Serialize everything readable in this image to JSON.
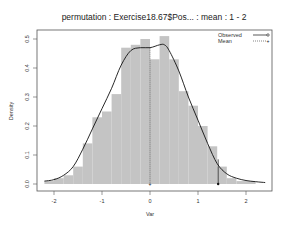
{
  "chart_data": {
    "type": "histogram",
    "title": "permutation : Exercise18.67$Pos... : mean : 1 - 2",
    "xlabel": "Var",
    "ylabel": "Density",
    "xlim": [
      -2.3,
      2.5
    ],
    "ylim": [
      0,
      0.52
    ],
    "xticks": [
      -2,
      -1,
      0,
      1,
      2
    ],
    "yticks": [
      0.0,
      0.1,
      0.2,
      0.3,
      0.4,
      0.5
    ],
    "xtick_labels": [
      "-2",
      "-1",
      "0",
      "1",
      "2"
    ],
    "ytick_labels": [
      "0.0",
      "0.1",
      "0.2",
      "0.3",
      "0.4",
      "0.5"
    ],
    "grid": false,
    "legend_position": "top-right",
    "bin_width": 0.2,
    "bins": [
      {
        "left": -2.2,
        "density": 0.01
      },
      {
        "left": -2.0,
        "density": 0.02
      },
      {
        "left": -1.8,
        "density": 0.03
      },
      {
        "left": -1.6,
        "density": 0.06
      },
      {
        "left": -1.4,
        "density": 0.14
      },
      {
        "left": -1.2,
        "density": 0.23
      },
      {
        "left": -1.0,
        "density": 0.25
      },
      {
        "left": -0.8,
        "density": 0.31
      },
      {
        "left": -0.6,
        "density": 0.47
      },
      {
        "left": -0.4,
        "density": 0.48
      },
      {
        "left": -0.2,
        "density": 0.5
      },
      {
        "left": 0.0,
        "density": 0.43
      },
      {
        "left": 0.2,
        "density": 0.51
      },
      {
        "left": 0.4,
        "density": 0.43
      },
      {
        "left": 0.6,
        "density": 0.32
      },
      {
        "left": 0.8,
        "density": 0.27
      },
      {
        "left": 1.0,
        "density": 0.2
      },
      {
        "left": 1.2,
        "density": 0.13
      },
      {
        "left": 1.4,
        "density": 0.06
      },
      {
        "left": 1.6,
        "density": 0.02
      },
      {
        "left": 1.8,
        "density": 0.01
      },
      {
        "left": 2.0,
        "density": 0.01
      }
    ],
    "density_curve": {
      "x": [
        -2.2,
        -2.0,
        -1.8,
        -1.6,
        -1.4,
        -1.2,
        -1.0,
        -0.8,
        -0.6,
        -0.4,
        -0.2,
        0.0,
        0.2,
        0.3,
        0.4,
        0.6,
        0.8,
        1.0,
        1.2,
        1.4,
        1.6,
        1.8,
        2.0,
        2.2,
        2.4
      ],
      "y": [
        0.01,
        0.015,
        0.03,
        0.06,
        0.12,
        0.19,
        0.26,
        0.33,
        0.41,
        0.46,
        0.47,
        0.47,
        0.48,
        0.48,
        0.46,
        0.39,
        0.3,
        0.22,
        0.14,
        0.07,
        0.035,
        0.02,
        0.012,
        0.008,
        0.005
      ]
    },
    "series": [
      {
        "name": "Observed",
        "style": "solid line with open circle",
        "value": 1.42
      },
      {
        "name": "Mean",
        "style": "dotted line with plus",
        "value": 0.0
      }
    ]
  },
  "legend": {
    "items": [
      {
        "label": "Observed"
      },
      {
        "label": "Mean"
      }
    ]
  }
}
